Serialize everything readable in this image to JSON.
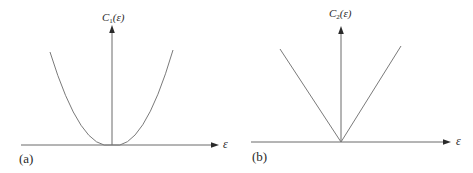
{
  "figure": {
    "panels": [
      {
        "tag": "(a)",
        "y_axis_label": {
          "symbol": "C",
          "subscript": "1",
          "argument": "(ε)"
        },
        "x_axis_label": "ε",
        "curve_type": "parabola",
        "description": "C1(ε) proportional to ε², minimum at ε = 0"
      },
      {
        "tag": "(b)",
        "y_axis_label": {
          "symbol": "C",
          "subscript": "2",
          "argument": "(ε)"
        },
        "x_axis_label": "ε",
        "curve_type": "absolute-value (V shape)",
        "description": "C2(ε) proportional to |ε|, kink at ε = 0"
      }
    ],
    "colors": {
      "line": "#6e6e6e",
      "axis": "#4a4a4a",
      "text": "#2a2a2a",
      "background": "#ffffff"
    }
  }
}
